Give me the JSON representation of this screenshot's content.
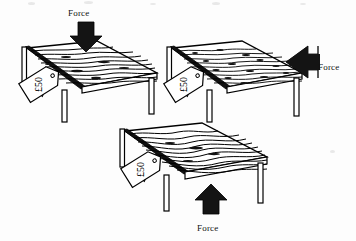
{
  "figure": {
    "title": "",
    "background_color": "#fdfdfd",
    "ink_color": "#000000",
    "wood_fill": "#ffffff",
    "arrow_color": "#111111",
    "tag_text": "£50"
  },
  "scenes": [
    {
      "id": "table-force-down",
      "force_label": "Force",
      "force_direction": "down",
      "price_tag": "£50",
      "grain_style": "straight-horizontal"
    },
    {
      "id": "table-force-sideways",
      "force_label": "Force",
      "force_direction": "left",
      "price_tag": "£50",
      "grain_style": "fine-speckled"
    },
    {
      "id": "table-force-up",
      "force_label": "Force",
      "force_direction": "up",
      "price_tag": "£50",
      "grain_style": "wavy"
    }
  ]
}
